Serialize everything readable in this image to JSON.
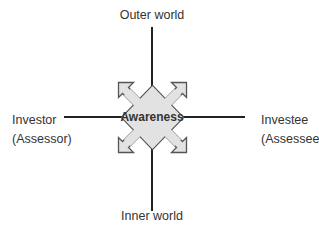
{
  "diagram": {
    "title": "Awareness",
    "center_label": "Awareness",
    "axes": {
      "top": "Outer world",
      "bottom": "Inner world",
      "left": {
        "line1": "Investor",
        "line2": "(Assessor)"
      },
      "right": {
        "line1": "Investee",
        "line2": "(Assessee)"
      }
    },
    "colors": {
      "line": "#222222",
      "shape_fill": "#e2e2e2",
      "shape_stroke": "#555555",
      "text": "#333333"
    }
  }
}
